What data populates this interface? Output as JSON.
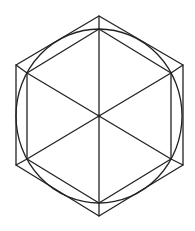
{
  "diagram": {
    "type": "geometric-construction",
    "stroke_color": "#222222",
    "background_color": "#ffffff",
    "stroke_width": 1.3,
    "center": [
      99,
      116
    ],
    "outer_hexagon": {
      "points": [
        [
          99,
          16
        ],
        [
          183,
          65
        ],
        [
          183,
          165
        ],
        [
          99,
          216
        ],
        [
          16,
          165
        ],
        [
          16,
          65
        ]
      ]
    },
    "circle": {
      "cx": 99,
      "cy": 116,
      "rx": 83,
      "ry": 87
    },
    "inner_hexagon": {
      "points": [
        [
          99,
          29
        ],
        [
          171,
          73
        ],
        [
          171,
          159
        ],
        [
          99,
          203
        ],
        [
          27,
          159
        ],
        [
          27,
          73
        ]
      ]
    },
    "diagonals": [
      {
        "from": [
          99,
          16
        ],
        "to": [
          99,
          216
        ]
      },
      {
        "from": [
          27,
          73
        ],
        "to": [
          171,
          159
        ]
      },
      {
        "from": [
          171,
          73
        ],
        "to": [
          27,
          159
        ]
      }
    ],
    "corner_connectors": [
      {
        "from": [
          16,
          65
        ],
        "to": [
          27,
          73
        ]
      },
      {
        "from": [
          183,
          65
        ],
        "to": [
          171,
          73
        ]
      },
      {
        "from": [
          16,
          165
        ],
        "to": [
          27,
          159
        ]
      },
      {
        "from": [
          183,
          165
        ],
        "to": [
          171,
          159
        ]
      }
    ]
  }
}
